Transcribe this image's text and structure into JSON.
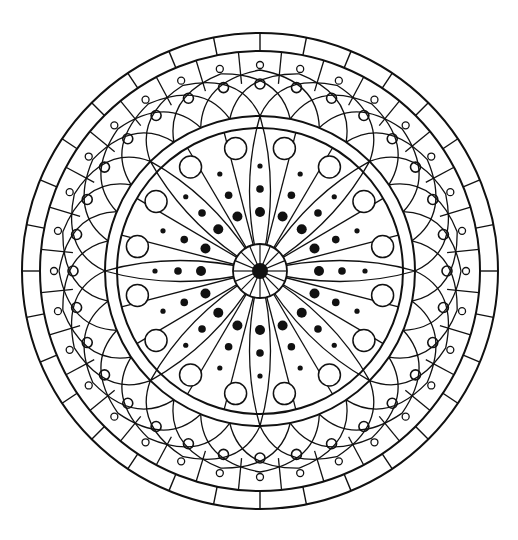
{
  "image": {
    "title": "Circular mandala line-art coloring page",
    "width": 518,
    "height": 540,
    "background": "#ffffff",
    "stroke_color": "#111111"
  },
  "mandala": {
    "center": [
      260,
      271
    ],
    "rings": {
      "outer_radius": 238,
      "band_inner_radius": 220,
      "inner_ring_outer_radius": 155,
      "inner_ring_inner_radius": 143,
      "center_circle_radius": 27,
      "center_dot_radius": 8
    },
    "outer_band": {
      "segments": 32,
      "offset_deg": 0
    },
    "arch_band": {
      "arches": 32,
      "tip_radius": 201,
      "span_deg": 22.5,
      "medium_circle": {
        "radius_pos": 187,
        "r": 5
      },
      "small_circle": {
        "radius_pos": 206,
        "r": 3.5
      },
      "divider_start_radius": 188
    },
    "inner_field": {
      "lancet_petals": {
        "count": 8,
        "offset_deg": 0,
        "half_width_deg": 6.5
      },
      "straight_wedges": {
        "count": 8,
        "offset_deg": 22.5,
        "half_width_deg": 8
      },
      "dot_rays": {
        "count": 16,
        "dots": [
          {
            "radius_pos": 59,
            "r": 5
          },
          {
            "radius_pos": 82,
            "r": 3.8
          },
          {
            "radius_pos": 105,
            "r": 2.6
          }
        ]
      },
      "big_circles": {
        "count": 16,
        "offset_deg": 11.25,
        "radius_pos": 125,
        "r": 11
      },
      "center_spokes": 16
    }
  }
}
